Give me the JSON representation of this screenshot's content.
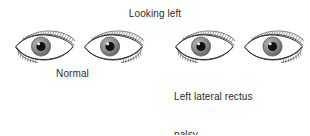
{
  "figure": {
    "title": "Looking left",
    "background_color": "#ffffff",
    "ink_color": "#2b2b2b",
    "width": 310,
    "height": 135
  },
  "groups": [
    {
      "id": "normal",
      "label": "Normal",
      "label_lines": [
        "Normal"
      ],
      "eyes": [
        {
          "side": "right-eye",
          "iris_position": "left",
          "iris_offset": -9,
          "label": "right eye adducted"
        },
        {
          "side": "left-eye",
          "iris_position": "left",
          "iris_offset": -9,
          "label": "left eye abducted"
        }
      ]
    },
    {
      "id": "palsy",
      "label": "Left lateral rectus palsy (VI nerve)",
      "label_lines": [
        "Left lateral rectus",
        "palsy",
        "(VI nerve)"
      ],
      "eyes": [
        {
          "side": "right-eye",
          "iris_position": "left",
          "iris_offset": -9,
          "label": "right eye adducted"
        },
        {
          "side": "left-eye",
          "iris_position": "center",
          "iris_offset": -1,
          "label": "left eye fails to abduct"
        }
      ]
    }
  ],
  "colors": {
    "iris": "#8e8e90",
    "iris_edge": "#55555a",
    "pupil": "#111111",
    "highlight": "#ffffff",
    "sclera": "#ffffff",
    "line": "#3a3a3a",
    "brow_hatch": "#4a4a4a"
  }
}
